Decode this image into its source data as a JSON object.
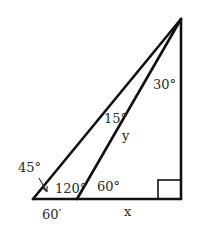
{
  "diagram": {
    "type": "geometry-triangle",
    "points": {
      "apex": [
        181,
        19
      ],
      "left": [
        33,
        199
      ],
      "middle": [
        77,
        199
      ],
      "right_angle": [
        181,
        199
      ]
    },
    "labels": {
      "angle_top_right": "30°",
      "angle_apex_between": "15°",
      "side_y": "y",
      "angle_left": "45°",
      "angle_middle_inner": "120°",
      "angle_middle_outer": "60°",
      "side_left_base": "60′",
      "side_x": "x"
    },
    "right_angle_marker": true,
    "colors": {
      "line": "#111111",
      "text": "#2a2a2a",
      "background": "#ffffff"
    }
  }
}
